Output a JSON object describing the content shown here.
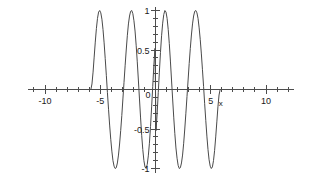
{
  "chart_data": {
    "type": "line",
    "title": "",
    "subtitle": "",
    "xlabel": "x",
    "ylabel": "",
    "xlim": [
      -11.5,
      12.5
    ],
    "ylim": [
      -1,
      1
    ],
    "grid": false,
    "legend": null,
    "x_ticks_major": [
      -10,
      -5,
      5,
      10
    ],
    "x_tick_labels": [
      "-10",
      "-5",
      "5",
      "10"
    ],
    "x_ticks_minor": [
      -11,
      -9,
      -8,
      -7,
      -6,
      -4,
      -3,
      -2,
      -1,
      1,
      2,
      3,
      4,
      6,
      7,
      8,
      9,
      11,
      12
    ],
    "y_ticks_major": [
      1,
      0.5,
      -0.5,
      -1
    ],
    "y_tick_labels": [
      "1",
      "0.5",
      "-0.5",
      "-1"
    ],
    "origin_label": "0",
    "y_ticks_minor": [
      0.9,
      0.8,
      0.7,
      0.6,
      0.4,
      0.3,
      0.2,
      0.1,
      -0.1,
      -0.2,
      -0.3,
      -0.4,
      -0.6,
      -0.7,
      -0.8,
      -0.9
    ],
    "series": [
      {
        "name": "f(x)",
        "color": "#4a4a4a",
        "description": "Odd-symmetric oscillating wave, amplitude 1, nonzero only for |x| < 5.8, with chirped frequency increasing toward the origin",
        "x": [
          -5.85,
          -5.75,
          -5.65,
          -5.55,
          -5.45,
          -5.35,
          -5.25,
          -5.15,
          -5.05,
          -4.95,
          -4.85,
          -4.75,
          -4.65,
          -4.55,
          -4.45,
          -4.35,
          -4.25,
          -4.15,
          -4.05,
          -3.95,
          -3.85,
          -3.75,
          -3.65,
          -3.55,
          -3.45,
          -3.35,
          -3.25,
          -3.15,
          -3.05,
          -2.95,
          -2.85,
          -2.75,
          -2.65,
          -2.55,
          -2.45,
          -2.35,
          -2.25,
          -2.15,
          -2.05,
          -1.95,
          -1.85,
          -1.75,
          -1.65,
          -1.55,
          -1.45,
          -1.35,
          -1.25,
          -1.15,
          -1.05,
          -0.95,
          -0.85,
          -0.75,
          -0.65,
          -0.55,
          -0.45,
          -0.35,
          -0.25,
          -0.15,
          -0.05,
          0.05,
          0.15,
          0.25,
          0.35,
          0.45,
          0.55,
          0.65,
          0.75,
          0.85,
          0.95,
          1.05,
          1.15,
          1.25,
          1.35,
          1.45,
          1.55,
          1.65,
          1.75,
          1.85,
          1.95,
          2.05,
          2.15,
          2.25,
          2.35,
          2.45,
          2.55,
          2.65,
          2.75,
          2.85,
          2.95,
          3.05,
          3.15,
          3.25,
          3.35,
          3.45,
          3.55,
          3.65,
          3.75,
          3.85,
          3.95,
          4.05,
          4.15,
          4.25,
          4.35,
          4.45,
          4.55,
          4.65,
          4.75,
          4.85,
          4.95,
          5.05,
          5.15,
          5.25,
          5.35,
          5.45,
          5.55,
          5.65,
          5.75,
          5.85
        ],
        "y": [
          0,
          0.07,
          0.22,
          0.41,
          0.6,
          0.77,
          0.9,
          0.98,
          1,
          0.97,
          0.89,
          0.76,
          0.59,
          0.39,
          0.18,
          -0.04,
          -0.25,
          -0.45,
          -0.63,
          -0.78,
          -0.9,
          -0.97,
          -1,
          -0.99,
          -0.93,
          -0.83,
          -0.69,
          -0.52,
          -0.33,
          -0.12,
          0.09,
          0.3,
          0.5,
          0.68,
          0.83,
          0.93,
          0.99,
          1,
          0.96,
          0.87,
          0.74,
          0.56,
          0.35,
          0.12,
          -0.12,
          -0.36,
          -0.58,
          -0.76,
          -0.9,
          -0.98,
          -1,
          -0.95,
          -0.84,
          -0.68,
          -0.47,
          -0.22,
          0.04,
          0.3,
          0.52,
          -0.52,
          -0.3,
          -0.04,
          0.22,
          0.47,
          0.68,
          0.84,
          0.95,
          1,
          0.98,
          0.9,
          0.76,
          0.58,
          0.36,
          0.12,
          -0.12,
          -0.35,
          -0.56,
          -0.74,
          -0.87,
          -0.96,
          -1,
          -0.99,
          -0.93,
          -0.83,
          -0.68,
          -0.5,
          -0.3,
          -0.09,
          0.12,
          0.33,
          0.52,
          0.69,
          0.83,
          0.93,
          0.99,
          1,
          0.97,
          0.9,
          0.78,
          0.63,
          0.45,
          0.25,
          0.04,
          -0.18,
          -0.39,
          -0.59,
          -0.76,
          -0.89,
          -0.97,
          -1,
          -0.98,
          -0.9,
          -0.77,
          -0.6,
          -0.41,
          -0.22,
          -0.07,
          0
        ]
      }
    ],
    "annotations": []
  },
  "axes": {
    "x_axis_name": "x"
  }
}
